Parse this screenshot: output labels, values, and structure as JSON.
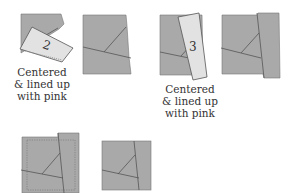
{
  "colors": {
    "fabric": "#a9a9a9",
    "fabric_light": "#e2e2e2",
    "stroke": "#555555",
    "stitch": "#8a8a8a",
    "text": "#333333"
  },
  "steps": [
    {
      "id": "step-2-placement",
      "piece_number": "2",
      "label_lines": [
        "Centered",
        "& lined up",
        "with pink"
      ]
    },
    {
      "id": "step-2-sewn"
    },
    {
      "id": "step-3-placement",
      "piece_number": "3",
      "label_lines": [
        "Centered",
        "& lined up",
        "with pink"
      ]
    },
    {
      "id": "step-3-sewn"
    },
    {
      "id": "trim-line"
    },
    {
      "id": "finished-block"
    }
  ]
}
